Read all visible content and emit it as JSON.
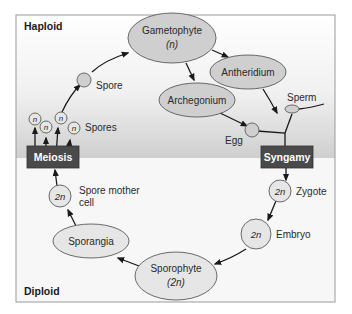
{
  "diagram": {
    "type": "life-cycle",
    "regions": {
      "haploid_label": "Haploid",
      "diploid_label": "Diploid"
    },
    "colors": {
      "frame": "#9a9a9a",
      "haploid_bg_top": "#ffffff",
      "haploid_bg_bottom": "#d2d2d2",
      "diploid_bg": "#f6f6f6",
      "node_fill": "#cfcfcf",
      "light_node_fill": "#e6e6e6",
      "process_box": "#4a4a4a",
      "process_text": "#ffffff"
    },
    "nodes": {
      "gametophyte": {
        "label": "Gametophyte",
        "sub": "(n)"
      },
      "antheridium": {
        "label": "Antheridium"
      },
      "archegonium": {
        "label": "Archegonium"
      },
      "sperm": {
        "label": "Sperm"
      },
      "egg": {
        "label": "Egg"
      },
      "spore": {
        "label": "Spore"
      },
      "spores": {
        "label": "Spores",
        "marker": "n"
      },
      "zygote": {
        "label": "Zygote",
        "marker": "2n"
      },
      "embryo": {
        "label": "Embryo",
        "marker": "2n"
      },
      "sporophyte": {
        "label": "Sporophyte",
        "sub": "(2n)"
      },
      "sporangia": {
        "label": "Sporangia"
      },
      "spore_mother_cell": {
        "label_line1": "Spore mother",
        "label_line2": "cell",
        "marker": "2n"
      }
    },
    "processes": {
      "meiosis": "Meiosis",
      "syngamy": "Syngamy"
    },
    "edges": [
      [
        "spores",
        "spore"
      ],
      [
        "spore",
        "gametophyte"
      ],
      [
        "gametophyte",
        "antheridium"
      ],
      [
        "gametophyte",
        "archegonium"
      ],
      [
        "antheridium",
        "sperm"
      ],
      [
        "archegonium",
        "egg"
      ],
      [
        "sperm",
        "syngamy"
      ],
      [
        "egg",
        "syngamy"
      ],
      [
        "syngamy",
        "zygote"
      ],
      [
        "zygote",
        "embryo"
      ],
      [
        "embryo",
        "sporophyte"
      ],
      [
        "sporophyte",
        "sporangia"
      ],
      [
        "sporangia",
        "spore_mother_cell"
      ],
      [
        "spore_mother_cell",
        "meiosis"
      ],
      [
        "meiosis",
        "spores"
      ]
    ]
  }
}
